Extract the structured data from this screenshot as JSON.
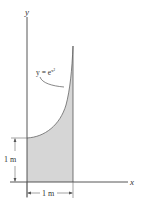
{
  "figure": {
    "axis_y_label": "y",
    "axis_x_label": "x",
    "curve_label_lhs": "y = e",
    "curve_label_exp": "x²",
    "height_dim_label": "1 m",
    "width_dim_label": "1 m",
    "colors": {
      "shade": "#d6d6d6",
      "line": "#555555",
      "text": "#333333"
    }
  }
}
